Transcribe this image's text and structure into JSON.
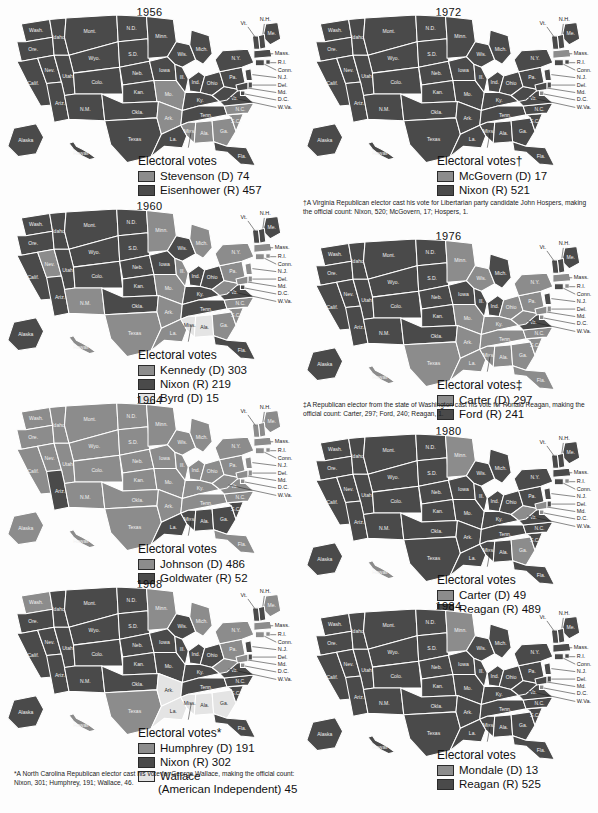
{
  "document": {
    "title": "United States Presidential Election Electoral Vote Maps 1956-1984",
    "colors": {
      "dark": "#4a4a4a",
      "mid": "#8c8c8c",
      "light": "#c9c9c9",
      "pale": "#e4e4e4",
      "border": "#ffffff",
      "page": "#fdfdfd",
      "text": "#1a1a1a"
    },
    "legend_title": "Electoral votes"
  },
  "state_labels": [
    "Wash.",
    "Ore.",
    "Idaho",
    "Mont.",
    "N.D.",
    "Minn.",
    "Wis.",
    "Mich.",
    "N.Y.",
    "Me.",
    "Nev.",
    "Utah",
    "Wyo.",
    "S.D.",
    "Iowa",
    "Ill.",
    "Ind.",
    "Ohio",
    "Pa.",
    "Mass.",
    "Calif.",
    "Colo.",
    "Neb.",
    "Mo.",
    "Ky.",
    "Va.",
    "N.H.",
    "Vt.",
    "R.I.",
    "Conn.",
    "Ariz.",
    "N.M.",
    "Kan.",
    "Ark.",
    "Tenn.",
    "N.C.",
    "N.J.",
    "Del.",
    "Md.",
    "D.C.",
    "W.Va.",
    "Okla.",
    "Texas",
    "La.",
    "Miss.",
    "Ala.",
    "Ga.",
    "S.C.",
    "Fla.",
    "Alaska",
    "Hawaii"
  ],
  "callout_labels": [
    "N.H.",
    "Vt.",
    "Mass.",
    "R.I.",
    "Conn.",
    "N.J.",
    "Del.",
    "Md.",
    "D.C.",
    "W.Va."
  ],
  "maps": [
    {
      "id": "map-1956",
      "year": "1956",
      "legend_title": "Electoral votes",
      "entries": [
        {
          "label": "Stevenson (D) 74",
          "tone": "mid"
        },
        {
          "label": "Eisenhower (R) 457",
          "tone": "dark"
        }
      ],
      "winner_tone": "dark",
      "loser_tone": "mid",
      "loser_states": [
        "MO",
        "AR",
        "AL",
        "GA",
        "SC",
        "MS",
        "NC"
      ],
      "third_tone": "pale",
      "third_states": []
    },
    {
      "id": "map-1960",
      "year": "1960",
      "legend_title": "Electoral votes",
      "entries": [
        {
          "label": "Kennedy (D) 303",
          "tone": "mid"
        },
        {
          "label": "Nixon (R) 219",
          "tone": "dark"
        },
        {
          "label": "Byrd (D) 15",
          "tone": "pale"
        }
      ],
      "winner_tone": "dark",
      "loser_tone": "mid",
      "loser_states": [
        "TX",
        "LA",
        "AR",
        "MO",
        "IL",
        "MI",
        "MN",
        "NM",
        "NV",
        "NC",
        "SC",
        "GA",
        "WV",
        "PA",
        "NY",
        "CT",
        "RI",
        "MA",
        "MD",
        "DE",
        "NJ",
        "HI"
      ],
      "third_tone": "pale",
      "third_states": [
        "MS",
        "AL"
      ]
    },
    {
      "id": "map-1964",
      "year": "1964",
      "legend_title": "Electoral votes",
      "entries": [
        {
          "label": "Johnson (D) 486",
          "tone": "mid"
        },
        {
          "label": "Goldwater (R) 52",
          "tone": "dark"
        }
      ],
      "winner_tone": "mid",
      "loser_tone": "dark",
      "loser_states": [
        "AZ",
        "LA",
        "MS",
        "AL",
        "GA",
        "SC"
      ],
      "third_tone": "pale",
      "third_states": []
    },
    {
      "id": "map-1968",
      "year": "1968",
      "legend_title": "Electoral votes*",
      "entries": [
        {
          "label": "Humphrey (D) 191",
          "tone": "mid"
        },
        {
          "label": "Nixon (R) 302",
          "tone": "dark"
        },
        {
          "label": "Wallace",
          "tone": "pale",
          "cont": "(American Independent) 45"
        }
      ],
      "winner_tone": "dark",
      "loser_tone": "mid",
      "loser_states": [
        "WA",
        "MN",
        "MI",
        "PA",
        "NY",
        "MA",
        "CT",
        "RI",
        "ME",
        "WV",
        "MD",
        "DC",
        "TX",
        "HI"
      ],
      "third_tone": "pale",
      "third_states": [
        "AR",
        "LA",
        "MS",
        "AL",
        "GA"
      ]
    },
    {
      "id": "map-1972",
      "year": "1972",
      "legend_title": "Electoral votes†",
      "entries": [
        {
          "label": "McGovern (D) 17",
          "tone": "mid"
        },
        {
          "label": "Nixon (R) 521",
          "tone": "dark"
        }
      ],
      "winner_tone": "dark",
      "loser_tone": "mid",
      "loser_states": [
        "MA",
        "DC"
      ],
      "third_tone": "pale",
      "third_states": []
    },
    {
      "id": "map-1976",
      "year": "1976",
      "legend_title": "Electoral votes‡",
      "entries": [
        {
          "label": "Carter (D) 297",
          "tone": "mid"
        },
        {
          "label": "Ford (R) 241",
          "tone": "dark"
        }
      ],
      "winner_tone": "mid",
      "loser_tone": "dark",
      "loser_states": [
        "WA",
        "OR",
        "CA",
        "NV",
        "ID",
        "MT",
        "WY",
        "UT",
        "AZ",
        "NM",
        "CO",
        "ND",
        "SD",
        "NE",
        "KS",
        "OK",
        "IA",
        "IL",
        "MI",
        "IN",
        "VA",
        "NH",
        "VT",
        "ME",
        "AK",
        "CT",
        "NJ"
      ],
      "third_tone": "pale",
      "third_states": []
    },
    {
      "id": "map-1980",
      "year": "1980",
      "legend_title": "Electoral votes",
      "entries": [
        {
          "label": "Carter (D) 49",
          "tone": "mid"
        },
        {
          "label": "Reagan (R) 489",
          "tone": "dark"
        }
      ],
      "winner_tone": "dark",
      "loser_tone": "mid",
      "loser_states": [
        "MN",
        "GA",
        "WV",
        "MD",
        "DC",
        "HI",
        "RI"
      ],
      "third_tone": "pale",
      "third_states": []
    },
    {
      "id": "map-1984",
      "year": "1984",
      "legend_title": "Electoral votes",
      "entries": [
        {
          "label": "Mondale (D) 13",
          "tone": "mid"
        },
        {
          "label": "Reagan (R) 525",
          "tone": "dark"
        }
      ],
      "winner_tone": "dark",
      "loser_tone": "mid",
      "loser_states": [
        "MN",
        "DC"
      ],
      "third_tone": "pale",
      "third_states": []
    }
  ],
  "footnotes": {
    "left_star": "*A North Carolina Republican elector cast his vote for George Wallace, making the official count: Nixon, 301; Humphrey, 191; Wallace, 46.",
    "right_dagger": "†A Virginia Republican elector cast his vote for Libertarian party candidate John Hospers, making the official count: Nixon, 520; McGovern, 17; Hospers, 1.",
    "right_doubledagger": "‡A Republican elector from the state of Washington cast his vote for Ronald Reagan, making the official count: Carter, 297; Ford, 240; Reagan, 1."
  }
}
